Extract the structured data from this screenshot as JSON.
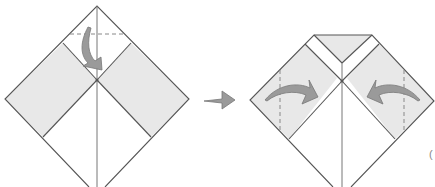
{
  "diagram": {
    "type": "origami-instructions",
    "steps": [
      {
        "id": "step-a",
        "description": "Square base diamond with two shaded diagonal bands; valley-fold top corner down to the center along the dashed line",
        "fold_line": "horizontal-dashed-near-top",
        "arrow": "curved-down"
      },
      {
        "id": "step-b",
        "description": "Top corner folded down; fold left and right flaps inward along vertical dashed lines",
        "fold_lines": [
          "vertical-dashed-left",
          "vertical-dashed-right"
        ],
        "arrows": [
          "curved-right",
          "curved-left"
        ]
      }
    ],
    "transition_arrow": "right-arrow",
    "partial_text": "("
  },
  "colors": {
    "paper": "#ffffff",
    "shaded": "#e8e8e8",
    "line": "#555555",
    "arrow": "#9a9a9a"
  }
}
